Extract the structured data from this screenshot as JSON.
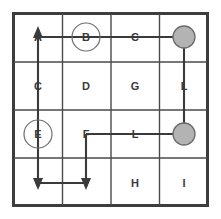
{
  "diagram": {
    "type": "grid-maze",
    "columns": 4,
    "rows": 4,
    "colors": {
      "background": "#ffffff",
      "outer_border": "#3d3d3d",
      "grid_line": "#4a4a4a",
      "letter": "#3a3a3a",
      "path": "#3a3a3a",
      "goal_fill": "#b3b3b3",
      "goal_stroke": "#6b6b6b",
      "ring_stroke": "#6e6e6e"
    },
    "cells": [
      {
        "id": "r1c1",
        "row": 1,
        "col": 1,
        "label": "A",
        "circled": false,
        "goal": false
      },
      {
        "id": "r1c2",
        "row": 1,
        "col": 2,
        "label": "B",
        "circled": true,
        "goal": false
      },
      {
        "id": "r1c3",
        "row": 1,
        "col": 3,
        "label": "C",
        "circled": false,
        "goal": false
      },
      {
        "id": "r1c4",
        "row": 1,
        "col": 4,
        "label": "",
        "circled": false,
        "goal": true
      },
      {
        "id": "r2c1",
        "row": 2,
        "col": 1,
        "label": "C",
        "circled": false,
        "goal": false
      },
      {
        "id": "r2c2",
        "row": 2,
        "col": 2,
        "label": "D",
        "circled": false,
        "goal": false
      },
      {
        "id": "r2c3",
        "row": 2,
        "col": 3,
        "label": "G",
        "circled": false,
        "goal": false
      },
      {
        "id": "r2c4",
        "row": 2,
        "col": 4,
        "label": "L",
        "circled": false,
        "goal": false
      },
      {
        "id": "r3c1",
        "row": 3,
        "col": 1,
        "label": "E",
        "circled": true,
        "goal": false
      },
      {
        "id": "r3c2",
        "row": 3,
        "col": 2,
        "label": "F",
        "circled": false,
        "goal": false
      },
      {
        "id": "r3c3",
        "row": 3,
        "col": 3,
        "label": "L",
        "circled": false,
        "goal": false
      },
      {
        "id": "r3c4",
        "row": 3,
        "col": 4,
        "label": "",
        "circled": false,
        "goal": true
      },
      {
        "id": "r4c1",
        "row": 4,
        "col": 1,
        "label": "V",
        "circled": false,
        "goal": false
      },
      {
        "id": "r4c2",
        "row": 4,
        "col": 2,
        "label": "Y",
        "circled": false,
        "goal": false
      },
      {
        "id": "r4c3",
        "row": 4,
        "col": 3,
        "label": "H",
        "circled": false,
        "goal": false
      },
      {
        "id": "r4c4",
        "row": 4,
        "col": 4,
        "label": "I",
        "circled": false,
        "goal": false
      }
    ],
    "goal_markers": [
      {
        "id": "goal-top-right",
        "row": 1,
        "col": 4,
        "radius": 11
      },
      {
        "id": "goal-middle-right",
        "row": 3,
        "col": 4,
        "radius": 11
      }
    ],
    "circled_cells": [
      "B",
      "E"
    ],
    "path_segments": [
      {
        "id": "seg-top-horizontal",
        "from": "r1c1",
        "to": "r1c4",
        "orientation": "horizontal"
      },
      {
        "id": "seg-right-vertical",
        "from": "r1c4",
        "to": "r3c4",
        "orientation": "vertical"
      },
      {
        "id": "seg-mid-horizontal",
        "from": "r3c4",
        "to": "r3c2",
        "orientation": "horizontal"
      },
      {
        "id": "seg-mid-down",
        "from": "r3c2",
        "to": "r4c2",
        "orientation": "vertical"
      },
      {
        "id": "seg-bottom-horizontal",
        "from": "r4c2",
        "to": "r4c1",
        "orientation": "horizontal"
      },
      {
        "id": "seg-left-vertical",
        "from": "r4c1",
        "to": "r1c1",
        "orientation": "vertical"
      }
    ],
    "arrowheads": [
      {
        "id": "arrow-up-at-a",
        "cell": "r1c1",
        "direction": "up"
      },
      {
        "id": "arrow-down-at-v",
        "cell": "r4c1",
        "direction": "down"
      },
      {
        "id": "arrow-down-at-y",
        "cell": "r4c2",
        "direction": "down"
      }
    ]
  }
}
